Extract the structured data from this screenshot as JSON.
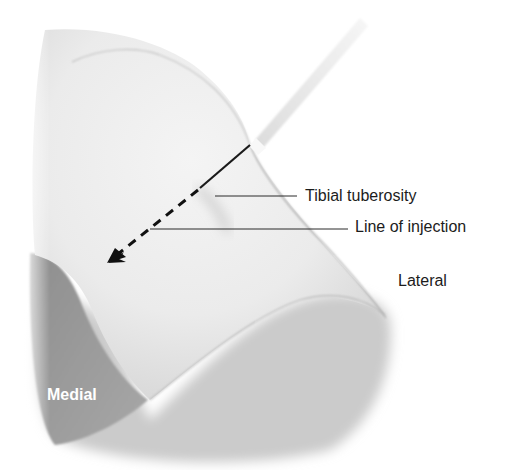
{
  "figure": {
    "labels": {
      "tibial_tuberosity": "Tibial tuberosity",
      "line_of_injection": "Line of injection",
      "lateral": "Lateral",
      "medial": "Medial"
    },
    "colors": {
      "background": "#ffffff",
      "skin_light": "#efefef",
      "skin_mid": "#d9d9d9",
      "shadow_dark": "#9a9a9a",
      "lower_leg": "#c4c4c4",
      "needle": "#1a1a1a",
      "syringe": "#e6e6e6",
      "text": "#1c1c1c",
      "text_on_dark": "#ffffff"
    }
  }
}
